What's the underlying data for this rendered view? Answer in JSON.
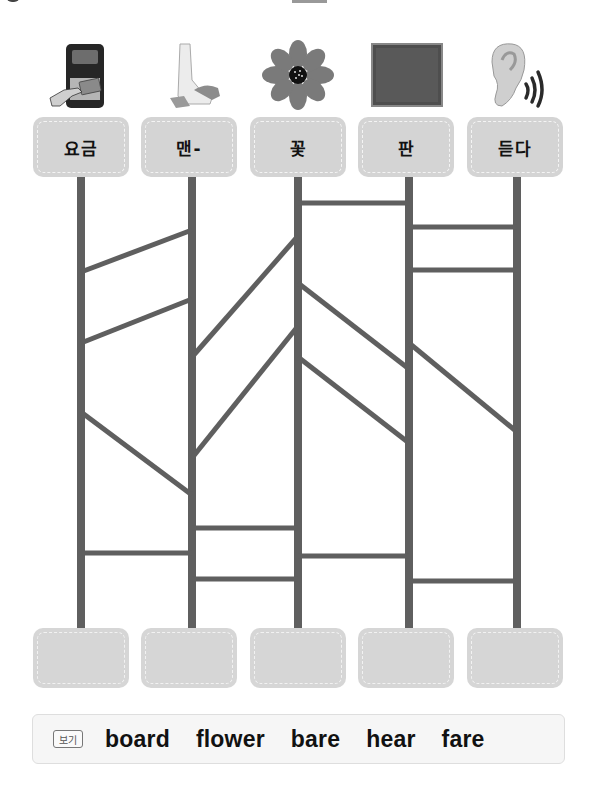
{
  "worksheet": {
    "instruction_type": "ladder-matching",
    "columns": [
      {
        "picture": "fare-machine-card-icon",
        "label": "요금"
      },
      {
        "picture": "bare-foot-icon",
        "label": "맨-"
      },
      {
        "picture": "flower-icon",
        "label": "꽃"
      },
      {
        "picture": "board-icon",
        "label": "판"
      },
      {
        "picture": "ear-hearing-icon",
        "label": "듣다"
      }
    ],
    "answers": [
      "",
      "",
      "",
      "",
      ""
    ],
    "word_bank": {
      "badge": "보기",
      "words": [
        "board",
        "flower",
        "bare",
        "hear",
        "fare"
      ]
    }
  },
  "colors": {
    "ladder": "#5f5f5f",
    "box_fill": "#d4d4d4",
    "box_dash": "#f4f4f4"
  },
  "ladder": {
    "verticals_x": [
      81,
      192,
      298,
      409,
      517
    ],
    "top_y": 177,
    "bottom_y": 628,
    "rungs": [
      {
        "from": 0,
        "to": 1,
        "y1": 272,
        "y2": 230
      },
      {
        "from": 0,
        "to": 1,
        "y1": 343,
        "y2": 299
      },
      {
        "from": 0,
        "to": 1,
        "y1": 412,
        "y2": 495
      },
      {
        "from": 0,
        "to": 1,
        "y1": 553,
        "y2": 553
      },
      {
        "from": 1,
        "to": 2,
        "y1": 357,
        "y2": 236
      },
      {
        "from": 1,
        "to": 2,
        "y1": 458,
        "y2": 326
      },
      {
        "from": 1,
        "to": 2,
        "y1": 528,
        "y2": 528
      },
      {
        "from": 1,
        "to": 2,
        "y1": 579,
        "y2": 579
      },
      {
        "from": 2,
        "to": 3,
        "y1": 203,
        "y2": 203
      },
      {
        "from": 2,
        "to": 3,
        "y1": 283,
        "y2": 369
      },
      {
        "from": 2,
        "to": 3,
        "y1": 357,
        "y2": 443
      },
      {
        "from": 2,
        "to": 3,
        "y1": 556,
        "y2": 556
      },
      {
        "from": 3,
        "to": 4,
        "y1": 227,
        "y2": 227
      },
      {
        "from": 3,
        "to": 4,
        "y1": 270,
        "y2": 270
      },
      {
        "from": 3,
        "to": 4,
        "y1": 343,
        "y2": 432
      },
      {
        "from": 3,
        "to": 4,
        "y1": 581,
        "y2": 581
      }
    ]
  }
}
